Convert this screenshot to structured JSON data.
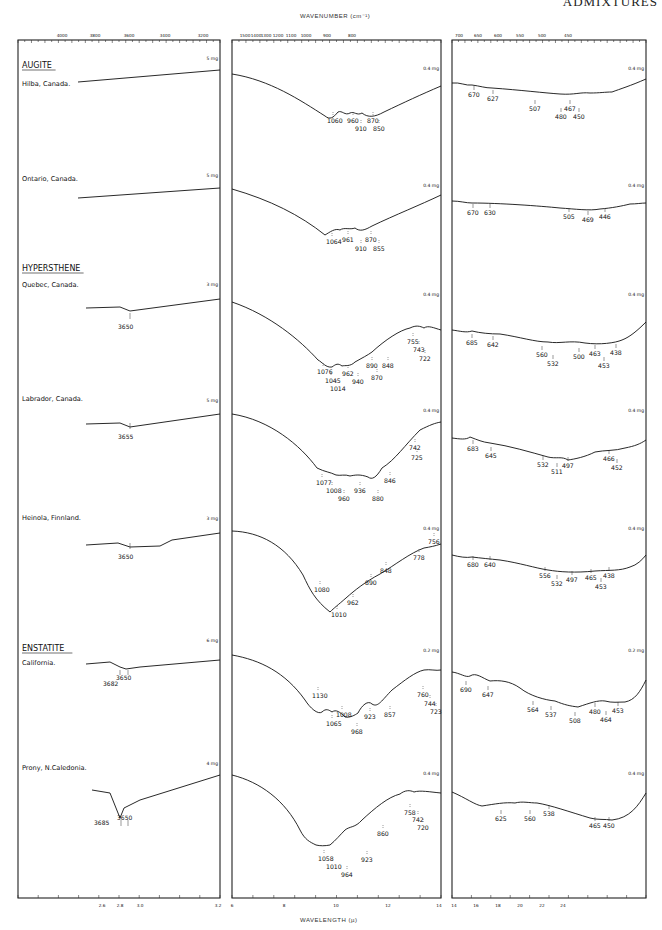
{
  "header": {
    "running_title": "ADMIXTURES"
  },
  "axes": {
    "top_title": "WAVENUMBER (cm⁻¹)",
    "bottom_title": "WAVELENGTH (µ)",
    "panel1_top_ticks": [
      "4000",
      "3800",
      "3600",
      "3400",
      "3200"
    ],
    "panel2_top_ticks": [
      "1500",
      "1400",
      "1300",
      "1200",
      "1100",
      "1000",
      "900",
      "800"
    ],
    "panel3_top_ticks": [
      "700",
      "650",
      "600",
      "550",
      "500",
      "450"
    ],
    "panel1_bottom_ticks": [
      "2.6",
      "2.8",
      "3.0",
      "3.2"
    ],
    "panel2_bottom_ticks": [
      "6",
      "8",
      "10",
      "12",
      "14"
    ],
    "panel3_bottom_ticks": [
      "14",
      "16",
      "18",
      "20",
      "22",
      "24"
    ]
  },
  "chart_data": {
    "type": "line",
    "xlabel_top": "Wavenumber (cm-1)",
    "xlabel_bottom": "Wavelength (µ)",
    "panels": [
      {
        "name": "OH region",
        "wavenumber_range": [
          4000,
          3200
        ],
        "wavelength_range": [
          2.5,
          3.2
        ]
      },
      {
        "name": "Mid IR",
        "wavenumber_range": [
          1650,
          710
        ],
        "wavelength_range": [
          6,
          14
        ]
      },
      {
        "name": "Far IR",
        "wavenumber_range": [
          714,
          417
        ],
        "wavelength_range": [
          14,
          24
        ]
      }
    ],
    "groups": [
      {
        "mineral": "AUGITE",
        "samples": [
          {
            "locality": "Hilba, Canada.",
            "oh_mass": "5 mg",
            "mid_mass": "0.4 mg",
            "far_mass": "0.4 mg",
            "oh_bands": [],
            "mid_bands": [
              "1060",
              "960",
              "910",
              "870",
              "850"
            ],
            "far_bands": [
              "670",
              "627",
              "507",
              "480",
              "467",
              "450"
            ]
          },
          {
            "locality": "Ontario, Canada.",
            "oh_mass": "5 mg",
            "mid_mass": "0.4 mg",
            "far_mass": "0.4 mg",
            "oh_bands": [],
            "mid_bands": [
              "1064",
              "961",
              "910",
              "870",
              "855"
            ],
            "far_bands": [
              "670",
              "630",
              "505",
              "469",
              "446"
            ]
          }
        ]
      },
      {
        "mineral": "HYPERSTHENE",
        "samples": [
          {
            "locality": "Quebec, Canada.",
            "oh_mass": "3 mg",
            "mid_mass": "0.4 mg",
            "far_mass": "0.4 mg",
            "oh_bands": [
              "3650"
            ],
            "mid_bands": [
              "1076",
              "1045",
              "1014",
              "962",
              "940",
              "890",
              "870",
              "848",
              "755",
              "743",
              "722"
            ],
            "far_bands": [
              "685",
              "642",
              "560",
              "532",
              "500",
              "463",
              "453",
              "438"
            ]
          },
          {
            "locality": "Labrador, Canada.",
            "oh_mass": "5 mg",
            "mid_mass": "0.4 mg",
            "far_mass": "0.4 mg",
            "oh_bands": [
              "3655"
            ],
            "mid_bands": [
              "1077",
              "1008",
              "960",
              "936",
              "880",
              "846",
              "742",
              "725"
            ],
            "far_bands": [
              "683",
              "645",
              "532",
              "511",
              "497",
              "466",
              "452"
            ]
          },
          {
            "locality": "Heinola, Finnland.",
            "oh_mass": "3 mg",
            "mid_mass": "0.4 mg",
            "far_mass": "0.4 mg",
            "oh_bands": [
              "3650"
            ],
            "mid_bands": [
              "1080",
              "1010",
              "962",
              "890",
              "848",
              "778",
              "756"
            ],
            "far_bands": [
              "680",
              "640",
              "556",
              "532",
              "497",
              "465",
              "453",
              "438"
            ]
          }
        ]
      },
      {
        "mineral": "ENSTATITE",
        "samples": [
          {
            "locality": "California.",
            "oh_mass": "6 mg",
            "mid_mass": "0.2 mg",
            "far_mass": "0.2 mg",
            "oh_bands": [
              "3682",
              "3650"
            ],
            "mid_bands": [
              "1130",
              "1065",
              "1008",
              "968",
              "923",
              "857",
              "760",
              "744",
              "723"
            ],
            "far_bands": [
              "690",
              "647",
              "564",
              "537",
              "508",
              "480",
              "464",
              "453"
            ]
          },
          {
            "locality": "Prony, N.Caledonia.",
            "oh_mass": "4 mg",
            "mid_mass": "0.4 mg",
            "far_mass": "0.4 mg",
            "oh_bands": [
              "3685",
              "3650"
            ],
            "mid_bands": [
              "1058",
              "1010",
              "964",
              "923",
              "860",
              "758",
              "742",
              "720"
            ],
            "far_bands": [
              "625",
              "560",
              "538",
              "465",
              "450"
            ]
          }
        ]
      }
    ]
  },
  "layout": {
    "rows": [
      {
        "top": 55,
        "oh": [
          [
            78,
            80
          ],
          [
            220,
            44
          ]
        ],
        "mid": [
          [
            232,
            74
          ],
          [
            260,
            84
          ],
          [
            300,
            118
          ],
          [
            330,
            132
          ],
          [
            380,
            135
          ],
          [
            420,
            120
          ],
          [
            441,
            104
          ]
        ],
        "far": [
          [
            452,
            100
          ],
          [
            470,
            100
          ],
          [
            490,
            104
          ],
          [
            540,
            112
          ],
          [
            600,
            116
          ],
          [
            630,
            112
          ],
          [
            646,
            96
          ]
        ]
      }
    ]
  }
}
